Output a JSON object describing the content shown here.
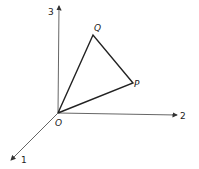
{
  "diagram": {
    "type": "3d-coordinate-axes-with-triangle",
    "axes": [
      {
        "label": "1",
        "direction": "out-left-down"
      },
      {
        "label": "2",
        "direction": "right"
      },
      {
        "label": "3",
        "direction": "up"
      }
    ],
    "points": {
      "origin": "O",
      "p": "P",
      "q": "Q"
    },
    "colors": {
      "line": "#222222",
      "axis": "#555555",
      "background": "#ffffff"
    }
  }
}
